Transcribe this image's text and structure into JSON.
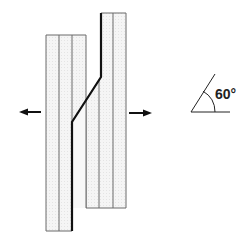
{
  "diagram": {
    "title": "",
    "colors": {
      "strip_fill": "#f3f3f3",
      "strip_line": "#6a6a6a",
      "joint_line": "#111111",
      "arrow": "#111111"
    },
    "left_strip": {
      "x": 46,
      "y": 35,
      "width": 40,
      "bottom": 231,
      "column_lines": [
        59,
        72
      ]
    },
    "right_strip": {
      "x": 86,
      "y": 13,
      "right": 126,
      "bottom": 208,
      "column_lines": [
        99,
        113
      ]
    },
    "joint_path": [
      [
        101,
        13
      ],
      [
        101,
        77
      ],
      [
        72,
        122
      ],
      [
        72,
        231
      ]
    ],
    "arrows": [
      {
        "name": "left-force-arrow",
        "direction": "left",
        "from": [
          41,
          112
        ],
        "to": [
          20,
          112
        ]
      },
      {
        "name": "right-force-arrow",
        "direction": "right",
        "from": [
          129,
          113
        ],
        "to": [
          151,
          113
        ]
      }
    ],
    "angle_symbol": {
      "vertex": [
        191,
        112
      ],
      "baseline_end": [
        230,
        112
      ],
      "ray_end": [
        217,
        75
      ],
      "label": "60°"
    }
  }
}
